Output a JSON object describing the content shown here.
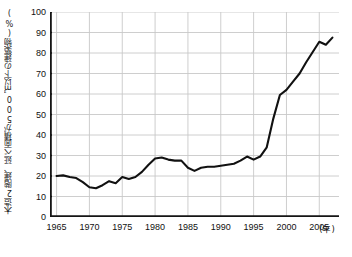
{
  "chart_data": {
    "type": "line",
    "title": "",
    "subtitle": "",
    "xlabel": "(年)",
    "ylabel": "木造2階建、延べ面積が500㎡以下の建築物(%)",
    "x_unit_note": "(年)",
    "xlim": [
      1964,
      2008
    ],
    "ylim": [
      0,
      100
    ],
    "y_ticks": [
      0,
      10,
      20,
      30,
      40,
      50,
      60,
      70,
      80,
      90,
      100
    ],
    "x_ticks": [
      1965,
      1970,
      1975,
      1980,
      1985,
      1990,
      1995,
      2000,
      2005
    ],
    "x_tick_labels": [
      "1965",
      "1970",
      "1975",
      "1980",
      "1985",
      "1990",
      "1995",
      "2000",
      "2005"
    ],
    "y_tick_labels": [
      "0",
      "10",
      "20",
      "30",
      "40",
      "50",
      "60",
      "70",
      "80",
      "90",
      "100"
    ],
    "grid": true,
    "grid_color": "#c8c8c8",
    "legend": false,
    "legend_position": "none",
    "line_color": "#111111",
    "line_width": 2.1,
    "markers": false,
    "series": [
      {
        "name": "木造2階建・延べ面積500㎡以下の建築物の割合",
        "x": [
          1965,
          1966,
          1967,
          1968,
          1969,
          1970,
          1971,
          1972,
          1973,
          1974,
          1975,
          1976,
          1977,
          1978,
          1979,
          1980,
          1981,
          1982,
          1983,
          1984,
          1985,
          1986,
          1987,
          1988,
          1989,
          1990,
          1991,
          1992,
          1993,
          1994,
          1995,
          1996,
          1997,
          1998,
          1999,
          2000,
          2001,
          2002,
          2003,
          2004,
          2005,
          2006,
          2007
        ],
        "values": [
          20.0,
          20.3,
          19.5,
          19.0,
          17.0,
          14.5,
          14.0,
          15.5,
          17.5,
          16.5,
          19.5,
          18.5,
          19.5,
          22.0,
          25.5,
          28.5,
          29.0,
          28.0,
          27.5,
          27.5,
          24.0,
          22.5,
          24.0,
          24.5,
          24.5,
          25.0,
          25.5,
          26.0,
          27.5,
          29.5,
          28.0,
          29.5,
          34.0,
          48.0,
          59.5,
          62.0,
          66.0,
          70.0,
          75.5,
          80.5,
          85.5,
          84.0,
          87.5
        ]
      }
    ]
  },
  "axis": {
    "y_title": "木造2階建、延べ面積が500㎡以下の建築物(%)",
    "x_unit": "(年)"
  }
}
